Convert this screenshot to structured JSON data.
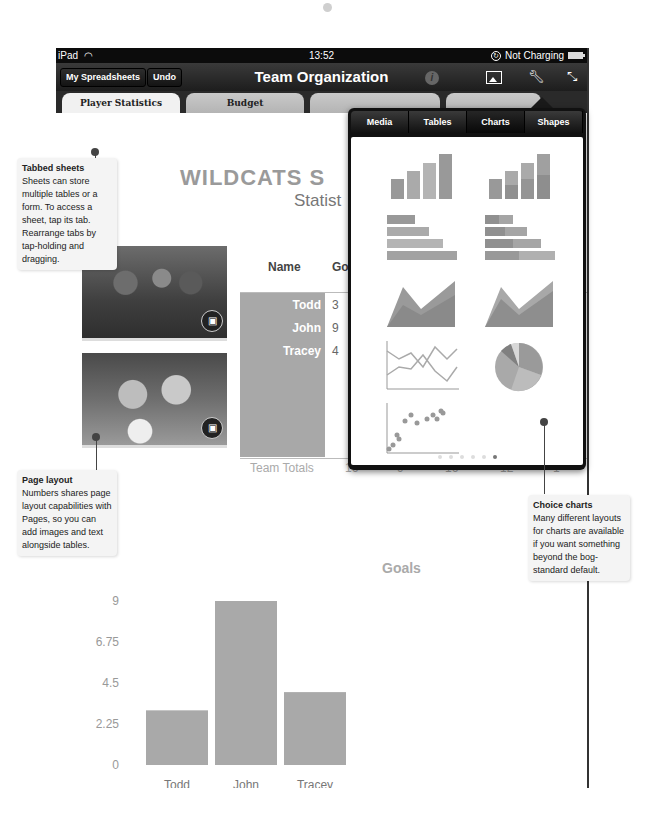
{
  "status_bar": {
    "device": "iPad",
    "time": "13:52",
    "charging": "Not Charging"
  },
  "toolbar": {
    "my_spreadsheets": "My Spreadsheets",
    "undo": "Undo",
    "title": "Team Organization",
    "icons": [
      "info-icon",
      "media-icon",
      "wrench-icon",
      "fullscreen-icon"
    ]
  },
  "tabs": [
    {
      "label": "Player Statistics",
      "active": true
    },
    {
      "label": "Budget",
      "active": false
    },
    {
      "label": "",
      "active": false
    },
    {
      "label": "",
      "active": false
    }
  ],
  "sheet": {
    "title": "WILDCATS S",
    "subtitle": "Statist",
    "table": {
      "headers": [
        "Name",
        "Go"
      ],
      "rows": [
        {
          "name": "Todd",
          "goals": "3"
        },
        {
          "name": "John",
          "goals": "9"
        },
        {
          "name": "Tracey",
          "goals": "4"
        }
      ],
      "totals_label": "Team Totals",
      "totals": [
        "16",
        "9",
        "16",
        "12",
        "1"
      ]
    }
  },
  "popover": {
    "tabs": [
      {
        "label": "Media",
        "active": false
      },
      {
        "label": "Tables",
        "active": false
      },
      {
        "label": "Charts",
        "active": true
      },
      {
        "label": "Shapes",
        "active": false
      }
    ],
    "chart_styles": [
      "column",
      "stacked-column",
      "bar",
      "stacked-bar",
      "area",
      "stacked-area",
      "line",
      "pie",
      "scatter"
    ],
    "page_count": 6,
    "current_page": 6
  },
  "callouts": {
    "tabbed": {
      "title": "Tabbed sheets",
      "body": "Sheets can store multiple tables or a form. To access a sheet, tap its tab. Rearrange tabs by tap-holding and dragging."
    },
    "layout": {
      "title": "Page layout",
      "body": "Numbers shares page layout capabilities with Pages, so you can add images and text alongside tables."
    },
    "charts": {
      "title": "Choice charts",
      "body": "Many different layouts for charts are available if you want something beyond the bog-standard default."
    }
  },
  "colors": {
    "bar": "#a9a9a9",
    "toolbar": "#1d1d1d"
  },
  "chart_data": {
    "type": "bar",
    "title": "Goals",
    "categories": [
      "Todd",
      "John",
      "Tracey"
    ],
    "values": [
      3,
      9,
      4
    ],
    "yticks": [
      "0",
      "2.25",
      "4.5",
      "6.75",
      "9"
    ],
    "ylim": [
      0,
      9
    ],
    "xlabel": "",
    "ylabel": "",
    "grid": false
  }
}
